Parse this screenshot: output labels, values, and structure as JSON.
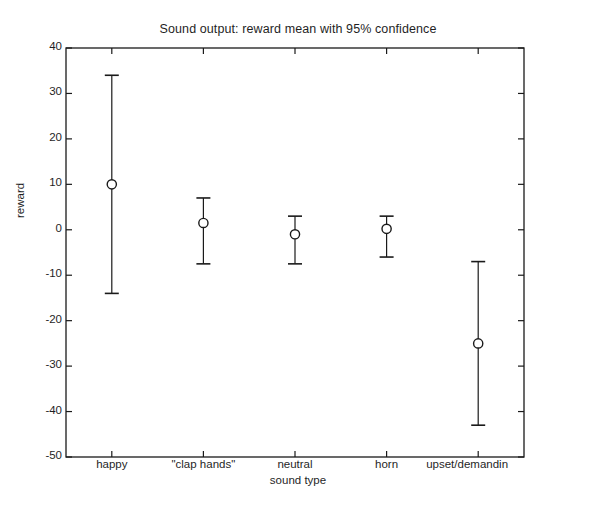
{
  "chart_data": {
    "type": "scatter",
    "title": "Sound output: reward mean with 95% confidence",
    "xlabel": "sound type",
    "ylabel": "reward",
    "grid": false,
    "legend": null,
    "ylim": [
      -50,
      40
    ],
    "yticks": [
      40,
      30,
      20,
      10,
      0,
      -10,
      -20,
      -30,
      -40,
      -50
    ],
    "ytick_labels": [
      "40",
      "30",
      "20",
      "10",
      "0",
      "-10",
      "-20",
      "-30",
      "-40",
      "-50"
    ],
    "categories": [
      "happy",
      "\"clap hands\"",
      "neutral",
      "horn",
      "upset/demandin"
    ],
    "xtick_labels": [
      "happy",
      "\"clap hands\"",
      "neutral",
      "horn",
      "upset/demandin"
    ],
    "series": [
      {
        "name": "reward mean with 95% confidence",
        "marker": "circle-open",
        "errorbar": "95% confidence interval",
        "values": [
          10,
          1.5,
          -1,
          0.2,
          -25
        ],
        "ci_lower": [
          -14,
          -7.5,
          -7.5,
          -6,
          -43
        ],
        "ci_upper": [
          34,
          7,
          3,
          3,
          -7
        ]
      }
    ]
  },
  "figure": {
    "background_color": "#ffffff",
    "axis_color": "#1a1a1a",
    "marker_color": "#1a1a1a"
  }
}
